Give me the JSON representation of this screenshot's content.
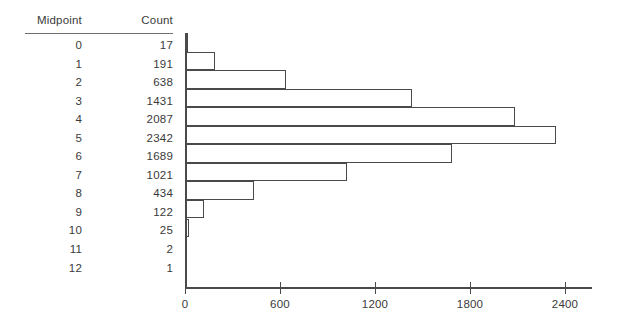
{
  "table": {
    "headers": {
      "midpoint": "Midpoint",
      "count": "Count"
    },
    "rows": [
      {
        "midpoint": "0",
        "count": "17"
      },
      {
        "midpoint": "1",
        "count": "191"
      },
      {
        "midpoint": "2",
        "count": "638"
      },
      {
        "midpoint": "3",
        "count": "1431"
      },
      {
        "midpoint": "4",
        "count": "2087"
      },
      {
        "midpoint": "5",
        "count": "2342"
      },
      {
        "midpoint": "6",
        "count": "1689"
      },
      {
        "midpoint": "7",
        "count": "1021"
      },
      {
        "midpoint": "8",
        "count": "434"
      },
      {
        "midpoint": "9",
        "count": "122"
      },
      {
        "midpoint": "10",
        "count": "25"
      },
      {
        "midpoint": "11",
        "count": "2"
      },
      {
        "midpoint": "12",
        "count": "1"
      }
    ]
  },
  "chart_data": {
    "type": "bar",
    "orientation": "horizontal",
    "title": "",
    "xlabel": "",
    "ylabel": "",
    "categories": [
      "0",
      "1",
      "2",
      "3",
      "4",
      "5",
      "6",
      "7",
      "8",
      "9",
      "10",
      "11",
      "12"
    ],
    "values": [
      17,
      191,
      638,
      1431,
      2087,
      2342,
      1689,
      1021,
      434,
      122,
      25,
      2,
      1
    ],
    "xlim": [
      0,
      2520
    ],
    "xticks": [
      0,
      600,
      1200,
      1800,
      2400
    ],
    "xtick_labels": [
      "0",
      "600",
      "1200",
      "1800",
      "2400"
    ],
    "grid": false,
    "legend": false,
    "bar_fill": "#ffffff",
    "bar_edge": "#4a4a4a",
    "axis_color": "#4a4a4a",
    "background": "#ffffff"
  }
}
